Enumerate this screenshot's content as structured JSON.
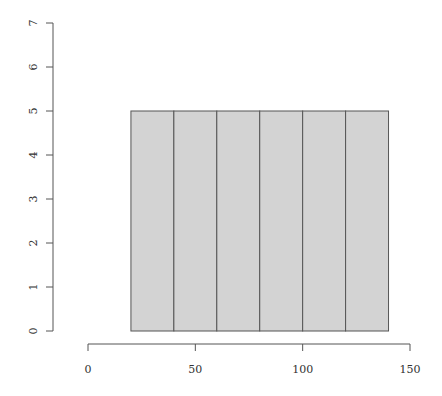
{
  "chart_data": {
    "type": "bar",
    "subtype": "histogram",
    "title": "",
    "xlabel": "",
    "ylabel": "",
    "breaks": [
      20,
      40,
      60,
      80,
      100,
      120,
      140
    ],
    "categories": [
      "20-40",
      "40-60",
      "60-80",
      "80-100",
      "100-120",
      "120-140"
    ],
    "values": [
      5,
      5,
      5,
      5,
      5,
      5
    ],
    "xlim": [
      0,
      150
    ],
    "ylim": [
      0,
      7
    ],
    "x_ticks": [
      0,
      50,
      100,
      150
    ],
    "y_ticks": [
      0,
      1,
      2,
      3,
      4,
      5,
      6,
      7
    ],
    "grid": false,
    "legend": null,
    "colors": {
      "bar_fill": "#d3d3d3",
      "bar_border": "#555555",
      "axis": "#555555",
      "text": "#333333"
    }
  }
}
